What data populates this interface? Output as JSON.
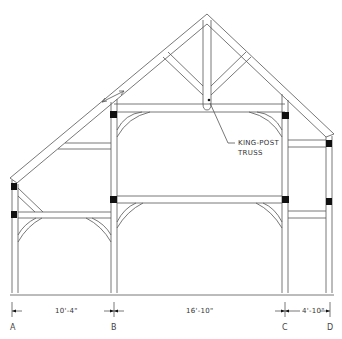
{
  "diagram": {
    "type": "timber-frame-section",
    "callout": {
      "line1": "KING-POST",
      "line2": "TRUSS"
    },
    "grid_lines": [
      {
        "label": "A",
        "x": 12
      },
      {
        "label": "B",
        "x": 114
      },
      {
        "label": "C",
        "x": 285
      },
      {
        "label": "D",
        "x": 330
      }
    ],
    "dimensions": [
      {
        "from": "A",
        "to": "B",
        "label": "10'-4\""
      },
      {
        "from": "B",
        "to": "C",
        "label": "16'-10\""
      },
      {
        "from": "C",
        "to": "D",
        "label": "4'-10\""
      }
    ],
    "colors": {
      "line": "#555555",
      "joint": "#111111",
      "background": "#ffffff"
    }
  }
}
